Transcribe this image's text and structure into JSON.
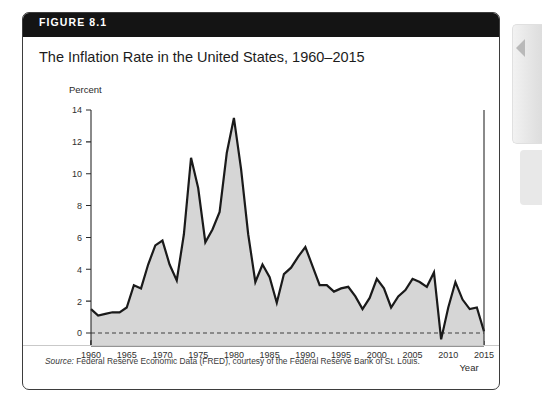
{
  "figure": {
    "number_label": "FIGURE 8.1",
    "title": "The Inflation Rate in the United States, 1960–2015",
    "source_label": "Source:",
    "source_text": " Federal Reserve Economic Data (FRED), courtesy of the Federal Reserve Bank of St. Louis."
  },
  "side_panel": {
    "chevron_icon": "chevron-left-icon"
  },
  "colors": {
    "header_bar": "#141414",
    "card_border": "#3d3d3d",
    "line": "#1a1a1a",
    "area_fill": "#d6d6d6",
    "zero_line": "#4a4a4a",
    "page_background": "#ffffff",
    "tab_background": "#e6e6e6"
  },
  "chart_data": {
    "type": "area",
    "title": "The Inflation Rate in the United States, 1960–2015",
    "xlabel": "Year",
    "ylabel": "Percent",
    "ylim": [
      -1.2,
      14
    ],
    "xlim": [
      1960,
      2015
    ],
    "yticks": [
      0,
      2,
      4,
      6,
      8,
      10,
      12,
      14
    ],
    "ytick_labels": [
      "0",
      "2",
      "4",
      "6",
      "8",
      "10",
      "12",
      "14"
    ],
    "xticks": [
      1960,
      1965,
      1970,
      1975,
      1980,
      1985,
      1990,
      1995,
      2000,
      2005,
      2010,
      2015
    ],
    "xtick_labels": [
      "1960",
      "1965",
      "1970",
      "1975",
      "1980",
      "1985",
      "1990",
      "1995",
      "2000",
      "2005",
      "2010",
      "2015"
    ],
    "grid": false,
    "legend": null,
    "zero_reference_line": 0,
    "series": [
      {
        "name": "Inflation rate",
        "x": [
          1960,
          1961,
          1962,
          1963,
          1964,
          1965,
          1966,
          1967,
          1968,
          1969,
          1970,
          1971,
          1972,
          1973,
          1974,
          1975,
          1976,
          1977,
          1978,
          1979,
          1980,
          1981,
          1982,
          1983,
          1984,
          1985,
          1986,
          1987,
          1988,
          1989,
          1990,
          1991,
          1992,
          1993,
          1994,
          1995,
          1996,
          1997,
          1998,
          1999,
          2000,
          2001,
          2002,
          2003,
          2004,
          2005,
          2006,
          2007,
          2008,
          2009,
          2010,
          2011,
          2012,
          2013,
          2014,
          2015
        ],
        "values": [
          1.5,
          1.1,
          1.2,
          1.3,
          1.3,
          1.6,
          3.0,
          2.8,
          4.3,
          5.5,
          5.8,
          4.3,
          3.3,
          6.2,
          11.0,
          9.1,
          5.7,
          6.5,
          7.6,
          11.3,
          13.5,
          10.3,
          6.2,
          3.2,
          4.3,
          3.5,
          1.9,
          3.7,
          4.1,
          4.8,
          5.4,
          4.2,
          3.0,
          3.0,
          2.6,
          2.8,
          2.9,
          2.3,
          1.5,
          2.2,
          3.4,
          2.8,
          1.6,
          2.3,
          2.7,
          3.4,
          3.2,
          2.9,
          3.8,
          -0.4,
          1.6,
          3.2,
          2.1,
          1.5,
          1.6,
          0.1
        ]
      }
    ]
  }
}
